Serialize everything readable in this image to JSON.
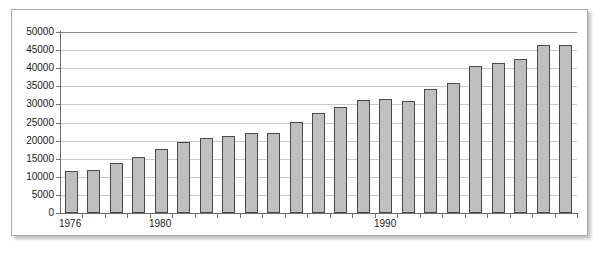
{
  "chart_data": {
    "type": "bar",
    "title": "",
    "subtitle": "",
    "xlabel": "",
    "ylabel": "",
    "grid": true,
    "legend": null,
    "legend_position": "none",
    "ylim": [
      0,
      50000
    ],
    "ytick_labels": [
      "50000",
      "45000",
      "40000",
      "35000",
      "30000",
      "25000",
      "20000",
      "15000",
      "10000",
      "5000",
      "0"
    ],
    "ytick_values": [
      50000,
      45000,
      40000,
      35000,
      30000,
      25000,
      20000,
      15000,
      10000,
      5000,
      0
    ],
    "xtick_labels": [
      "1976",
      "1980",
      "1990"
    ],
    "xtick_label_indices": [
      0,
      4,
      14
    ],
    "categories": [
      "1976",
      "1977",
      "1978",
      "1979",
      "1980",
      "1981",
      "1982",
      "1983",
      "1984",
      "1985",
      "1986",
      "1987",
      "1988",
      "1989",
      "1990",
      "1991",
      "1992",
      "1993",
      "1994",
      "1995",
      "1996",
      "1997",
      "1998"
    ],
    "values": [
      11700,
      11800,
      13700,
      15600,
      17800,
      19500,
      20800,
      21300,
      22100,
      22100,
      25200,
      27500,
      29200,
      31300,
      31500,
      31000,
      34300,
      36000,
      40500,
      41500,
      42500,
      46500,
      46500
    ],
    "series": [
      {
        "name": "",
        "values": [
          11700,
          11800,
          13700,
          15600,
          17800,
          19500,
          20800,
          21300,
          22100,
          22100,
          25200,
          27500,
          29200,
          31300,
          31500,
          31000,
          34300,
          36000,
          40500,
          41500,
          42500,
          46500,
          46500
        ]
      }
    ],
    "bar_fill_color": "#bfbfbf",
    "bar_border_color": "#4a4a4a",
    "gridline_color": "#c9c9c9",
    "axis_color": "#6e6e6e",
    "background_color": "#ffffff",
    "frame_border_color": "#a8a8a8"
  }
}
